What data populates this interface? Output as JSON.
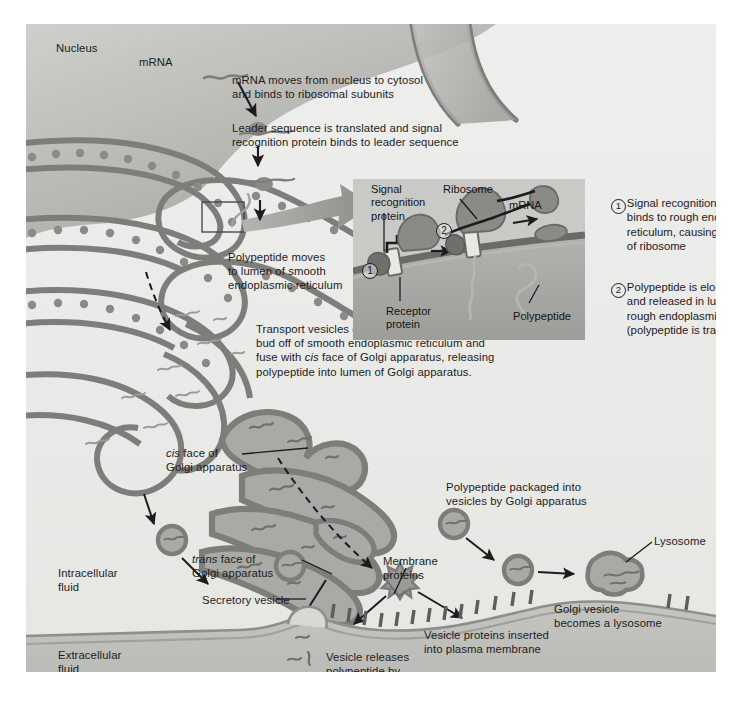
{
  "figure": {
    "background": "#ffffff",
    "plate_background": "#f2f2f0",
    "inset_background": "#c9c9c6",
    "membrane_color": "#7d7d7a",
    "organelle_fill": "#a9a9a5",
    "ink": "#1b1c1e"
  },
  "labels": {
    "nucleus": "Nucleus",
    "mrna": "mRNA",
    "intracellular_fluid": "Intracellular\nfluid",
    "extracellular_fluid": "Extracellular\nfluid",
    "cis_face": "cis face of\nGolgi apparatus",
    "cis_face_italic_word": "cis",
    "trans_face": "trans face of\nGolgi apparatus",
    "trans_face_italic_word": "trans",
    "secretory_vesicle": "Secretory vesicle",
    "membrane_proteins": "Membrane\nproteins",
    "lysosome": "Lysosome"
  },
  "callouts": [
    {
      "id": "mrna-export",
      "text": "mRNA moves from nucleus to cytosol\nand binds to ribosomal subunits"
    },
    {
      "id": "leader-sequence",
      "text": "Leader sequence is translated and signal\nrecognition protein binds to leader sequence"
    },
    {
      "id": "polypeptide-lumen",
      "text": "Polypeptide moves\nto lumen of smooth\nendoplasmic reticulum"
    },
    {
      "id": "transport-vesicles",
      "text": "Transport vesicles containing polypeptide\nbud off of smooth endoplasmic reticulum and\nfuse with cis face of Golgi apparatus, releasing\npolypeptide into lumen of Golgi apparatus.",
      "italic_word": "cis"
    },
    {
      "id": "polypeptide-packaged",
      "text": "Polypeptide packaged into\nvesicles by Golgi apparatus"
    },
    {
      "id": "golgi-vesicle-lysosome",
      "text": "Golgi vesicle\nbecomes a lysosome"
    },
    {
      "id": "vesicle-proteins-membrane",
      "text": "Vesicle proteins inserted\ninto plasma membrane"
    },
    {
      "id": "exocytosis",
      "text": "Vesicle releases\npolypeptide by\nexocytosis"
    }
  ],
  "inset": {
    "labels": {
      "signal_recognition_protein": "Signal\nrecognition\nprotein",
      "ribosome": "Ribosome",
      "mrna": "mRNA",
      "receptor_protein": "Receptor\nprotein",
      "polypeptide": "Polypeptide"
    },
    "markers": [
      "1",
      "2"
    ]
  },
  "steps": [
    {
      "number": "1",
      "text": "Signal recognition protein\nbinds to rough endoplasmic\nreticulum, causing attachment\nof ribosome"
    },
    {
      "number": "2",
      "text": "Polypeptide is elongated\nand released in lumen of\nrough endoplasmic reticulum\n(polypeptide is trapped in lumen)"
    }
  ]
}
